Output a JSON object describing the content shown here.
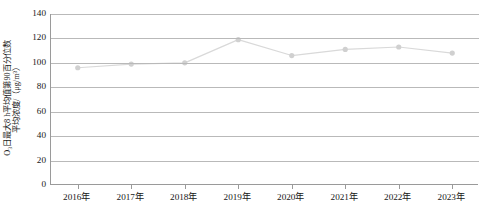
{
  "chart_data": {
    "type": "line",
    "title": "",
    "xlabel": "",
    "ylabel_line1": "O₃日最大8 h平均值第90百分位数",
    "ylabel_line2": "平均浓度/（μg/m³）",
    "categories": [
      "2016年",
      "2017年",
      "2018年",
      "2019年",
      "2020年",
      "2021年",
      "2022年",
      "2023年"
    ],
    "values": [
      96,
      99,
      100,
      119,
      106,
      111,
      113,
      108
    ],
    "yticks": [
      0,
      20,
      40,
      60,
      80,
      100,
      120,
      140
    ],
    "ylim": [
      0,
      140
    ],
    "grid": "horizontal",
    "legend": "none",
    "series_color": "#d9d9d9",
    "marker_color": "#d0d0d0",
    "gridline_color": "#b9b9b9",
    "axis_color": "#9a9a9a",
    "background": "#ffffff"
  }
}
